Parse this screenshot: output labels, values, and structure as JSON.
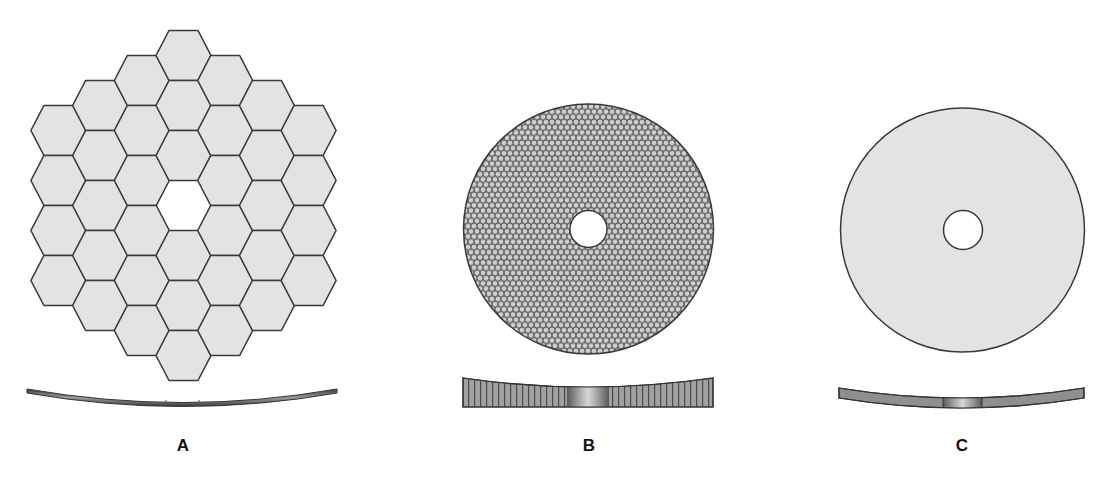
{
  "figure": {
    "colors": {
      "segment_fill": "#e3e3e3",
      "segment_stroke": "#3a3a3a",
      "background": "#ffffff",
      "honeycomb_dark": "#6b6b6b",
      "honeycomb_light": "#cfcfcf",
      "side_fill": "#8f8f8f",
      "side_stroke": "#333333"
    },
    "panels": [
      {
        "id": "A",
        "label": "A",
        "description": "Segmented mirror: 36 hexagonal segments with central hexagonal gap",
        "label_x": 183,
        "segments": 36
      },
      {
        "id": "B",
        "label": "B",
        "description": "Monolithic disc mirror with lightweighted honeycomb core and central hole",
        "label_x": 589
      },
      {
        "id": "C",
        "label": "C",
        "description": "Thin solid meniscus disc mirror with central hole",
        "label_x": 962
      }
    ]
  }
}
